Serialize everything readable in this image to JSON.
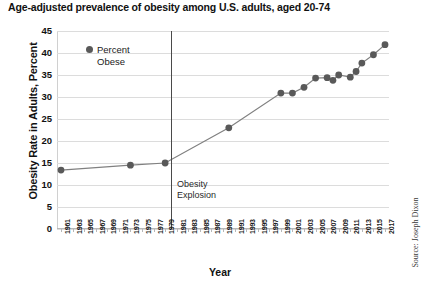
{
  "chart_data": {
    "type": "line",
    "title": "Age-adjusted prevalence of obesity among U.S. adults, aged 20-74",
    "xlabel": "Year",
    "ylabel": "Obesity Rate in Adults, Percent",
    "ylim": [
      0,
      45
    ],
    "ytick_step": 5,
    "yticks": [
      "45",
      "40",
      "35",
      "30",
      "25",
      "20",
      "15",
      "10",
      "5",
      "0"
    ],
    "xlim": [
      1961,
      2017
    ],
    "xtick_step": 2,
    "xticks": [
      "1961",
      "1963",
      "1965",
      "1967",
      "1969",
      "1971",
      "1973",
      "1975",
      "1977",
      "1979",
      "1981",
      "1983",
      "1985",
      "1987",
      "1989",
      "1991",
      "1993",
      "1995",
      "1997",
      "1999",
      "2001",
      "2003",
      "2005",
      "2007",
      "2009",
      "2011",
      "2013",
      "2015",
      "2017"
    ],
    "grid": "horizontal",
    "legend_position": "inside-top-left",
    "series": [
      {
        "name": "Percent Obese",
        "color": "#595959",
        "line_color": "#808080",
        "x": [
          1961,
          1973,
          1979,
          1990,
          1999,
          2001,
          2003,
          2005,
          2007,
          2008,
          2009,
          2011,
          2012,
          2013,
          2015,
          2017
        ],
        "values": [
          13.4,
          14.5,
          15.0,
          23.0,
          30.9,
          30.9,
          32.2,
          34.3,
          34.4,
          33.8,
          35.0,
          34.5,
          35.8,
          37.7,
          39.6,
          41.9
        ]
      }
    ],
    "annotations": [
      {
        "name": "obesity-explosion",
        "text_line1": "Obesity",
        "text_line2": "Explosion",
        "marker_x": 1980
      }
    ],
    "source": "Source: Joseph Dixon",
    "colors": {
      "marker": "#595959",
      "line": "#808080",
      "grid": "#dcdcdc",
      "axis": "#b8b8b8",
      "marker_line": "#4a4a4a",
      "text": "#111111"
    }
  }
}
